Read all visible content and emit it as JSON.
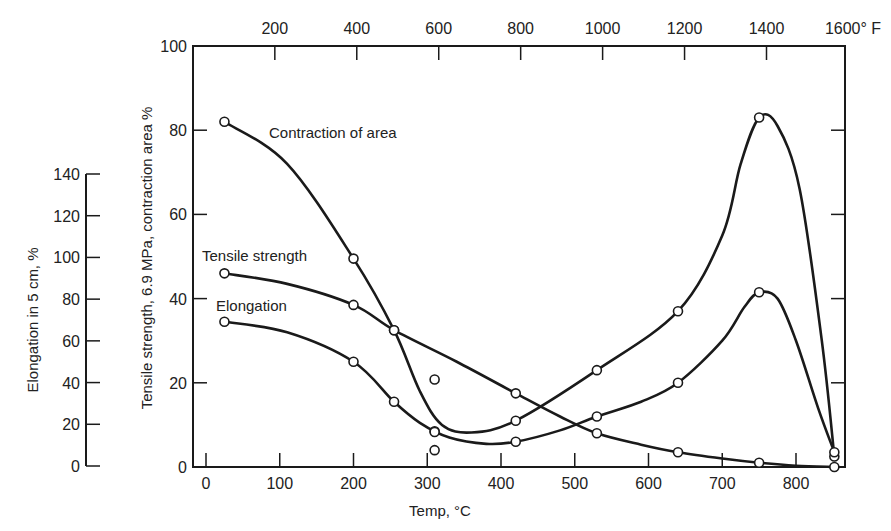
{
  "chart_data": {
    "type": "line",
    "title": "",
    "xlabel": "Temp, °C",
    "x_top_label_unit": "°F",
    "ylabel_left_outer": "Elongation in 5 cm, %",
    "ylabel_left_inner": "Tensile strength, 6.9 MPa, contraction area %",
    "xlim": [
      -18,
      865
    ],
    "ylim": [
      0,
      100
    ],
    "ylim_elongation": [
      0,
      140
    ],
    "grid": false,
    "legend": "inline labels",
    "x_ticks_bottom": [
      "0",
      "100",
      "200",
      "300",
      "400",
      "500",
      "600",
      "700",
      "800"
    ],
    "x_ticks_top": [
      "200",
      "400",
      "600",
      "800",
      "1000",
      "1200",
      "1400",
      "1600° F"
    ],
    "y_ticks_inner": [
      "0",
      "20",
      "40",
      "60",
      "80",
      "100"
    ],
    "y_ticks_outer": [
      "0",
      "20",
      "40",
      "60",
      "80",
      "100",
      "120",
      "140"
    ],
    "series": [
      {
        "name": "Contraction of area",
        "axis": "inner",
        "points": [
          [
            25,
            82
          ],
          [
            200,
            49.5
          ],
          [
            255,
            32.5
          ],
          [
            310,
            8.5
          ],
          [
            420,
            11
          ],
          [
            530,
            23
          ],
          [
            640,
            37
          ],
          [
            750,
            83
          ],
          [
            852,
            2.5
          ]
        ],
        "curve": [
          [
            25,
            82
          ],
          [
            110,
            72
          ],
          [
            200,
            49.5
          ],
          [
            255,
            32.5
          ],
          [
            290,
            18
          ],
          [
            320,
            10
          ],
          [
            360,
            8.2
          ],
          [
            420,
            11
          ],
          [
            530,
            23
          ],
          [
            640,
            37
          ],
          [
            700,
            55
          ],
          [
            725,
            72
          ],
          [
            750,
            83
          ],
          [
            775,
            81
          ],
          [
            805,
            66
          ],
          [
            835,
            30
          ],
          [
            852,
            2.5
          ]
        ]
      },
      {
        "name": "Tensile strength",
        "axis": "inner",
        "points": [
          [
            25,
            46
          ],
          [
            200,
            38.5
          ],
          [
            255,
            32.5
          ],
          [
            420,
            17.5
          ],
          [
            530,
            8
          ],
          [
            640,
            3.5
          ],
          [
            750,
            1
          ],
          [
            852,
            0
          ]
        ],
        "curve": [
          [
            25,
            46
          ],
          [
            110,
            43.5
          ],
          [
            200,
            38.5
          ],
          [
            255,
            32.5
          ],
          [
            340,
            25
          ],
          [
            420,
            17.5
          ],
          [
            480,
            12
          ],
          [
            530,
            8
          ],
          [
            590,
            5.3
          ],
          [
            640,
            3.5
          ],
          [
            700,
            2
          ],
          [
            750,
            1
          ],
          [
            800,
            0.3
          ],
          [
            852,
            0
          ]
        ]
      },
      {
        "name": "Elongation",
        "axis": "inner",
        "elongation_percent_scale": "elongation = 2 × inner value",
        "points": [
          [
            25,
            34.5
          ],
          [
            200,
            25
          ],
          [
            255,
            15.5
          ],
          [
            310,
            8.3
          ],
          [
            420,
            6
          ],
          [
            530,
            12
          ],
          [
            640,
            20
          ],
          [
            750,
            41.5
          ],
          [
            852,
            3.5
          ]
        ],
        "curve": [
          [
            25,
            34.5
          ],
          [
            110,
            32
          ],
          [
            200,
            25
          ],
          [
            255,
            15.5
          ],
          [
            290,
            10.5
          ],
          [
            330,
            7
          ],
          [
            380,
            5.5
          ],
          [
            420,
            6
          ],
          [
            480,
            8.7
          ],
          [
            530,
            12
          ],
          [
            590,
            15.5
          ],
          [
            640,
            20
          ],
          [
            700,
            30
          ],
          [
            730,
            38
          ],
          [
            750,
            41.5
          ],
          [
            775,
            40
          ],
          [
            800,
            30
          ],
          [
            830,
            14
          ],
          [
            852,
            3.5
          ]
        ]
      }
    ],
    "isolated_points": [
      [
        310,
        20.8
      ],
      [
        310,
        4
      ]
    ]
  },
  "labels": {
    "contraction": "Contraction of area",
    "tensile": "Tensile strength",
    "elongation": "Elongation",
    "xlabel": "Temp, °C",
    "ylabel_outer": "Elongation in 5 cm, %",
    "ylabel_inner": "Tensile strength, 6.9 MPa, contraction area %"
  }
}
